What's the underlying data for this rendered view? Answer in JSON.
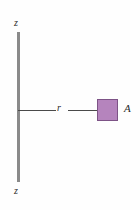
{
  "figure": {
    "type": "physics-diagram",
    "background_color": "#fefefe"
  },
  "axis": {
    "name": "z-axis",
    "orientation": "vertical",
    "color": "#8a8a8a",
    "label_top": "z",
    "label_bottom": "z"
  },
  "radius": {
    "name": "radial-distance",
    "label": "r",
    "color": "#4a4a4a"
  },
  "area_element": {
    "name": "area-element",
    "label": "A",
    "fill_color": "#b584bd",
    "border_color": "#7d5386"
  }
}
